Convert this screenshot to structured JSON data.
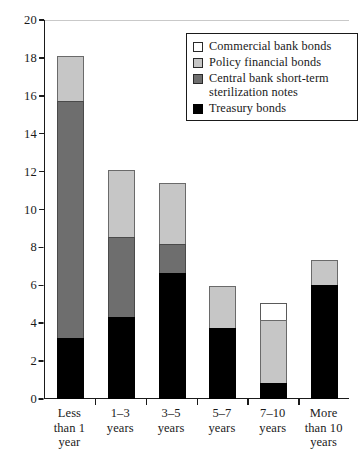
{
  "chart_data": {
    "type": "bar",
    "subtype": "stacked-bar",
    "title": "",
    "xlabel": "",
    "ylabel": "",
    "ylim": [
      0,
      20
    ],
    "ytick_step": 2,
    "ytick_labels": [
      "0",
      "2",
      "4",
      "6",
      "8",
      "10",
      "12",
      "14",
      "16",
      "18",
      "20"
    ],
    "grid": false,
    "legend_position": "top-right",
    "categories": [
      "Less\nthan 1\nyear",
      "1–3\nyears",
      "3–5\nyears",
      "5–7\nyears",
      "7–10\nyears",
      "More\nthan 10\nyears"
    ],
    "categories_flat": [
      "Less than 1 year",
      "1–3 years",
      "3–5 years",
      "5–7 years",
      "7–10 years",
      "More than 10 years"
    ],
    "stack_order_bottom_to_top": [
      "Treasury bonds",
      "Central bank short-term sterilization notes",
      "Policy financial bonds",
      "Commercial bank bonds"
    ],
    "series": [
      {
        "name": "Treasury bonds",
        "color": "#000000",
        "values": [
          3.2,
          4.35,
          6.65,
          3.75,
          0.85,
          6.0
        ]
      },
      {
        "name": "Central bank short-term sterilization notes",
        "color": "#6e6e6e",
        "values": [
          12.6,
          4.25,
          1.6,
          0,
          0,
          0
        ]
      },
      {
        "name": "Policy financial bonds",
        "color": "#c6c6c6",
        "values": [
          2.4,
          3.6,
          3.25,
          2.25,
          3.35,
          1.4
        ]
      },
      {
        "name": "Commercial bank bonds",
        "color": "#ffffff",
        "values": [
          0,
          0,
          0,
          0,
          1.0,
          0
        ]
      }
    ],
    "totals": [
      18.2,
      12.2,
      11.5,
      6.0,
      5.2,
      7.4
    ]
  },
  "legend": {
    "entries": [
      {
        "label": "Commercial bank bonds",
        "swatch": "sw-commercial"
      },
      {
        "label": "Policy financial bonds",
        "swatch": "sw-policy"
      },
      {
        "label": "Central bank short-term\nsterilization notes",
        "swatch": "sw-central"
      },
      {
        "label": "Treasury bonds",
        "swatch": "sw-treasury"
      }
    ]
  }
}
